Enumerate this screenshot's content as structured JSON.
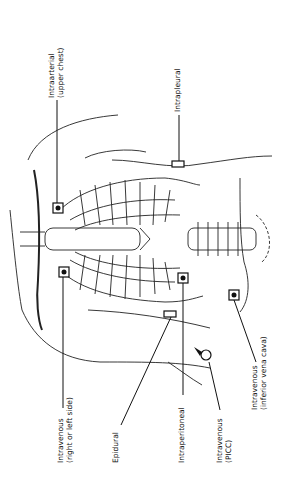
{
  "diagram": {
    "orientation": "rotated 90 degrees counter-clockwise",
    "labels": [
      {
        "id": "intraarterial",
        "line1": "Intraarterial",
        "line2": "(upper chest)"
      },
      {
        "id": "intrapleural",
        "line1": "Intrapleural",
        "line2": ""
      },
      {
        "id": "intravenous-side",
        "line1": "Intravenous",
        "line2": "(right or left side)"
      },
      {
        "id": "epidural",
        "line1": "Epidural",
        "line2": ""
      },
      {
        "id": "intraperitoneal",
        "line1": "Intraperitoneal",
        "line2": ""
      },
      {
        "id": "intravenous-picc",
        "line1": "Intravenous",
        "line2": "(PICC)"
      },
      {
        "id": "intravenous-ivc",
        "line1": "Intravenous",
        "line2": "(inferior vena cava)"
      }
    ]
  }
}
